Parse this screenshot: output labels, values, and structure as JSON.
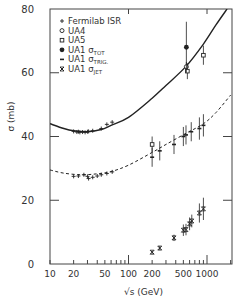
{
  "chart_data": {
    "type": "scatter",
    "title": "",
    "xlabel": "√s (GeV)",
    "ylabel": "σ (mb)",
    "xscale": "log",
    "xlim": [
      10,
      2000
    ],
    "ylim": [
      0,
      80
    ],
    "x_ticks": [
      10,
      20,
      50,
      100,
      200,
      500,
      1000
    ],
    "x_tick_labels": [
      "10",
      "20",
      "50",
      "100",
      "200",
      "500",
      "1000"
    ],
    "y_ticks": [
      0,
      20,
      40,
      60,
      80
    ],
    "y_tick_labels": [
      "0",
      "20",
      "40",
      "60",
      "80"
    ],
    "grid": false,
    "legend_position": "upper left",
    "legend": [
      {
        "marker": "+",
        "label": "Fermilab ISR"
      },
      {
        "marker": "○",
        "label": "UA4"
      },
      {
        "marker": "□",
        "label": "UA5"
      },
      {
        "marker": "●",
        "label": "UA1 σ",
        "sub": "TOT"
      },
      {
        "marker": "†",
        "label": "UA1 σ",
        "sub": "TRIG."
      },
      {
        "marker": "×",
        "label": "UA1 σ",
        "sub": "JET"
      }
    ],
    "curves": [
      {
        "name": "total cross-section fit",
        "style": "solid",
        "x": [
          10,
          15,
          20,
          30,
          45,
          60,
          100,
          200,
          300,
          540,
          900,
          1300,
          1800
        ],
        "y": [
          44,
          42.5,
          41.8,
          41.5,
          42.2,
          43.5,
          46,
          52,
          56,
          62,
          69,
          75,
          80
        ]
      },
      {
        "name": "inelastic cross-section fit",
        "style": "dashed",
        "x": [
          10,
          15,
          25,
          40,
          60,
          100,
          200,
          300,
          540,
          900,
          1300,
          2000
        ],
        "y": [
          29.5,
          28.5,
          28,
          28.3,
          29,
          31,
          35,
          37.5,
          41,
          44,
          47.5,
          53
        ]
      }
    ],
    "series": [
      {
        "name": "Fermilab ISR",
        "marker": "+",
        "x": [
          20,
          22,
          23,
          24,
          26,
          28,
          30,
          31,
          35,
          45,
          53,
          62,
          20,
          23,
          27,
          30,
          31,
          35,
          40,
          45,
          53,
          62
        ],
        "y": [
          41.6,
          41.4,
          41.5,
          41.3,
          41.4,
          41.3,
          41.5,
          41.6,
          41.8,
          42.5,
          43.8,
          44.5,
          27.5,
          27.6,
          28,
          27.5,
          26.8,
          27.2,
          27.6,
          28,
          28.4,
          28.9
        ]
      },
      {
        "name": "UA4",
        "marker": "○",
        "x": [
          546
        ],
        "y": [
          61.9
        ],
        "err": [
          1.5
        ]
      },
      {
        "name": "UA5",
        "marker": "□",
        "x": [
          200,
          546,
          900
        ],
        "y": [
          37.5,
          60.5,
          65.5
        ],
        "err": [
          2.5,
          2.5,
          3
        ]
      },
      {
        "name": "UA1 σ_TOT",
        "marker": "●",
        "x": [
          546
        ],
        "y": [
          68
        ],
        "err": [
          8
        ]
      },
      {
        "name": "UA1 σ_TRIG.",
        "marker": "†",
        "x": [
          200,
          250,
          380,
          500,
          540,
          630,
          800,
          900
        ],
        "y": [
          33.5,
          35.5,
          37.5,
          40,
          40.5,
          41.5,
          42.5,
          43.5
        ],
        "err": [
          3,
          3,
          3,
          3,
          3,
          3,
          3.5,
          3.5
        ]
      },
      {
        "name": "UA1 σ_JET",
        "marker": "×",
        "x": [
          200,
          250,
          380,
          500,
          540,
          600,
          640,
          800,
          900
        ],
        "y": [
          3.7,
          5,
          8.2,
          10.6,
          10.8,
          12.6,
          13.5,
          16,
          17.3
        ],
        "err": [
          0.5,
          0.6,
          1,
          1.8,
          1.8,
          2,
          2,
          3,
          3.5
        ]
      }
    ]
  }
}
